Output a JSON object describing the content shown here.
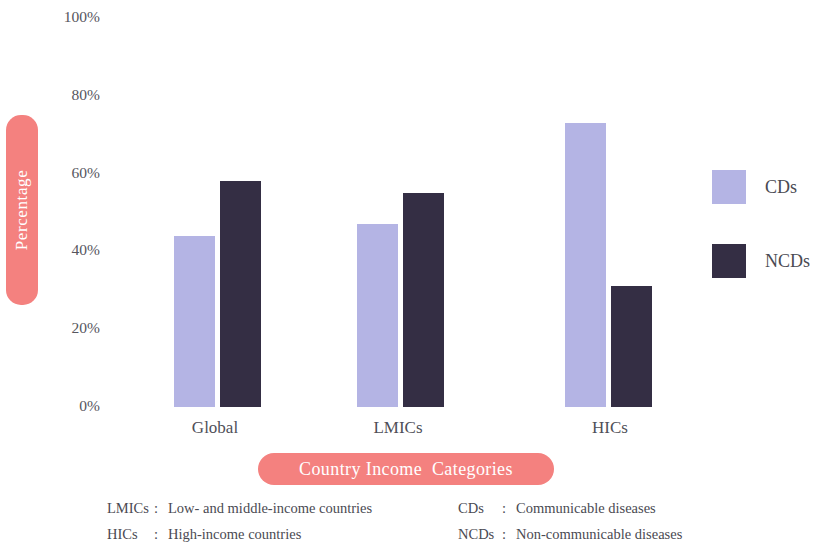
{
  "chart_data": {
    "type": "bar",
    "title": "",
    "categories": [
      "Global",
      "LMICs",
      "HICs"
    ],
    "series": [
      {
        "name": "CDs",
        "values": [
          44,
          47,
          73
        ],
        "color": "#b4b4e4"
      },
      {
        "name": "NCDs",
        "values": [
          58,
          55,
          31
        ],
        "color": "#342e44"
      }
    ],
    "xlabel": "Country Income  Categories",
    "ylabel": "Percentage",
    "ylim": [
      0,
      100
    ],
    "ytick_labels": [
      "100%",
      "80%",
      "60%",
      "40%",
      "20%",
      "0%"
    ],
    "ytick_values": [
      100,
      80,
      60,
      40,
      20,
      0
    ],
    "grid": false,
    "legend_position": "right",
    "legend": [
      "CDs",
      "NCDs"
    ],
    "accent_color": "#f4817f",
    "text_color": "#4a4a52",
    "background": "#ffffff"
  },
  "footnotes": {
    "left": [
      {
        "key": "LMICs",
        "sep": ":",
        "value": "Low- and middle-income countries"
      },
      {
        "key": "HICs",
        "sep": ":",
        "value": "High-income countries"
      }
    ],
    "right": [
      {
        "key": "CDs",
        "sep": ":",
        "value": "Communicable diseases"
      },
      {
        "key": "NCDs",
        "sep": ":",
        "value": "Non-communicable diseases"
      }
    ]
  }
}
